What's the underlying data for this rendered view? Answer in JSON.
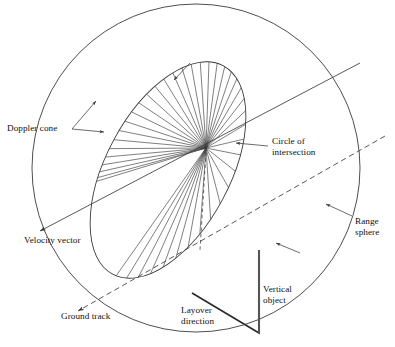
{
  "figure": {
    "title": "",
    "background_color": "#ffffff",
    "line_color": "#3a3a3a",
    "text_color": "#111111",
    "width": 395,
    "height": 347
  },
  "labels": {
    "doppler_cone": "Doppler cone",
    "circle_of_intersection": "Circle of\nintersection",
    "range_sphere": "Range\nsphere",
    "velocity_vector": "Velocity vector",
    "ground_track": "Ground track",
    "layover_direction": "Layover\ndirection",
    "vertical_object": "Vertical\nobject"
  },
  "geometry": {
    "range_sphere": {
      "type": "circle",
      "cx": 196,
      "cy": 168,
      "r": 164
    },
    "circle_of_intersection": {
      "type": "ellipse",
      "cx": 168,
      "cy": 170,
      "rx": 118,
      "ry": 62,
      "rotation_deg": -62
    },
    "apex": {
      "x": 206,
      "y": 148
    },
    "doppler_cone_ray_count": 40,
    "velocity_vector": {
      "from": {
        "x": 38,
        "y": 232
      },
      "to": {
        "x": 360,
        "y": 63
      },
      "style": "solid",
      "arrow_at": "from"
    },
    "ground_track": {
      "from": {
        "x": 76,
        "y": 312
      },
      "to": {
        "x": 385,
        "y": 136
      },
      "style": "dashed",
      "arrow_at": "from"
    },
    "vertical_object": {
      "from": {
        "x": 259,
        "y": 250
      },
      "to": {
        "x": 259,
        "y": 333
      },
      "style": "solid-thick"
    },
    "layover_triangle": {
      "points": [
        {
          "x": 192,
          "y": 293
        },
        {
          "x": 259,
          "y": 333
        },
        {
          "x": 259,
          "y": 250
        }
      ]
    },
    "nadir_dashed": {
      "from": {
        "x": 206,
        "y": 150
      },
      "to": {
        "x": 200,
        "y": 248
      },
      "style": "dashed"
    }
  },
  "leader_lines": [
    {
      "name": "doppler-cone-leader-1",
      "from": {
        "x": 72,
        "y": 129
      },
      "to": {
        "x": 104,
        "y": 132
      }
    },
    {
      "name": "doppler-cone-leader-2",
      "from": {
        "x": 72,
        "y": 129
      },
      "to": {
        "x": 96,
        "y": 101
      }
    },
    {
      "name": "circle-of-intersection-leader",
      "from": {
        "x": 268,
        "y": 146
      },
      "to": {
        "x": 236,
        "y": 143
      }
    },
    {
      "name": "range-sphere-leader",
      "from": {
        "x": 352,
        "y": 216
      },
      "to": {
        "x": 326,
        "y": 204
      }
    },
    {
      "name": "range-sphere-leader-2",
      "from": {
        "x": 300,
        "y": 253
      },
      "to": {
        "x": 276,
        "y": 243
      }
    },
    {
      "name": "cone-inner-arrow",
      "from": {
        "x": 190,
        "y": 63
      },
      "to": {
        "x": 174,
        "y": 80
      }
    }
  ],
  "label_positions": {
    "doppler_cone": {
      "left": 7,
      "top": 123
    },
    "circle_of_intersection": {
      "left": 272,
      "top": 136
    },
    "range_sphere": {
      "left": 355,
      "top": 216
    },
    "velocity_vector": {
      "left": 24,
      "top": 235
    },
    "ground_track": {
      "left": 61,
      "top": 311
    },
    "layover_direction": {
      "left": 181,
      "top": 305
    },
    "vertical_object": {
      "left": 263,
      "top": 284
    }
  }
}
